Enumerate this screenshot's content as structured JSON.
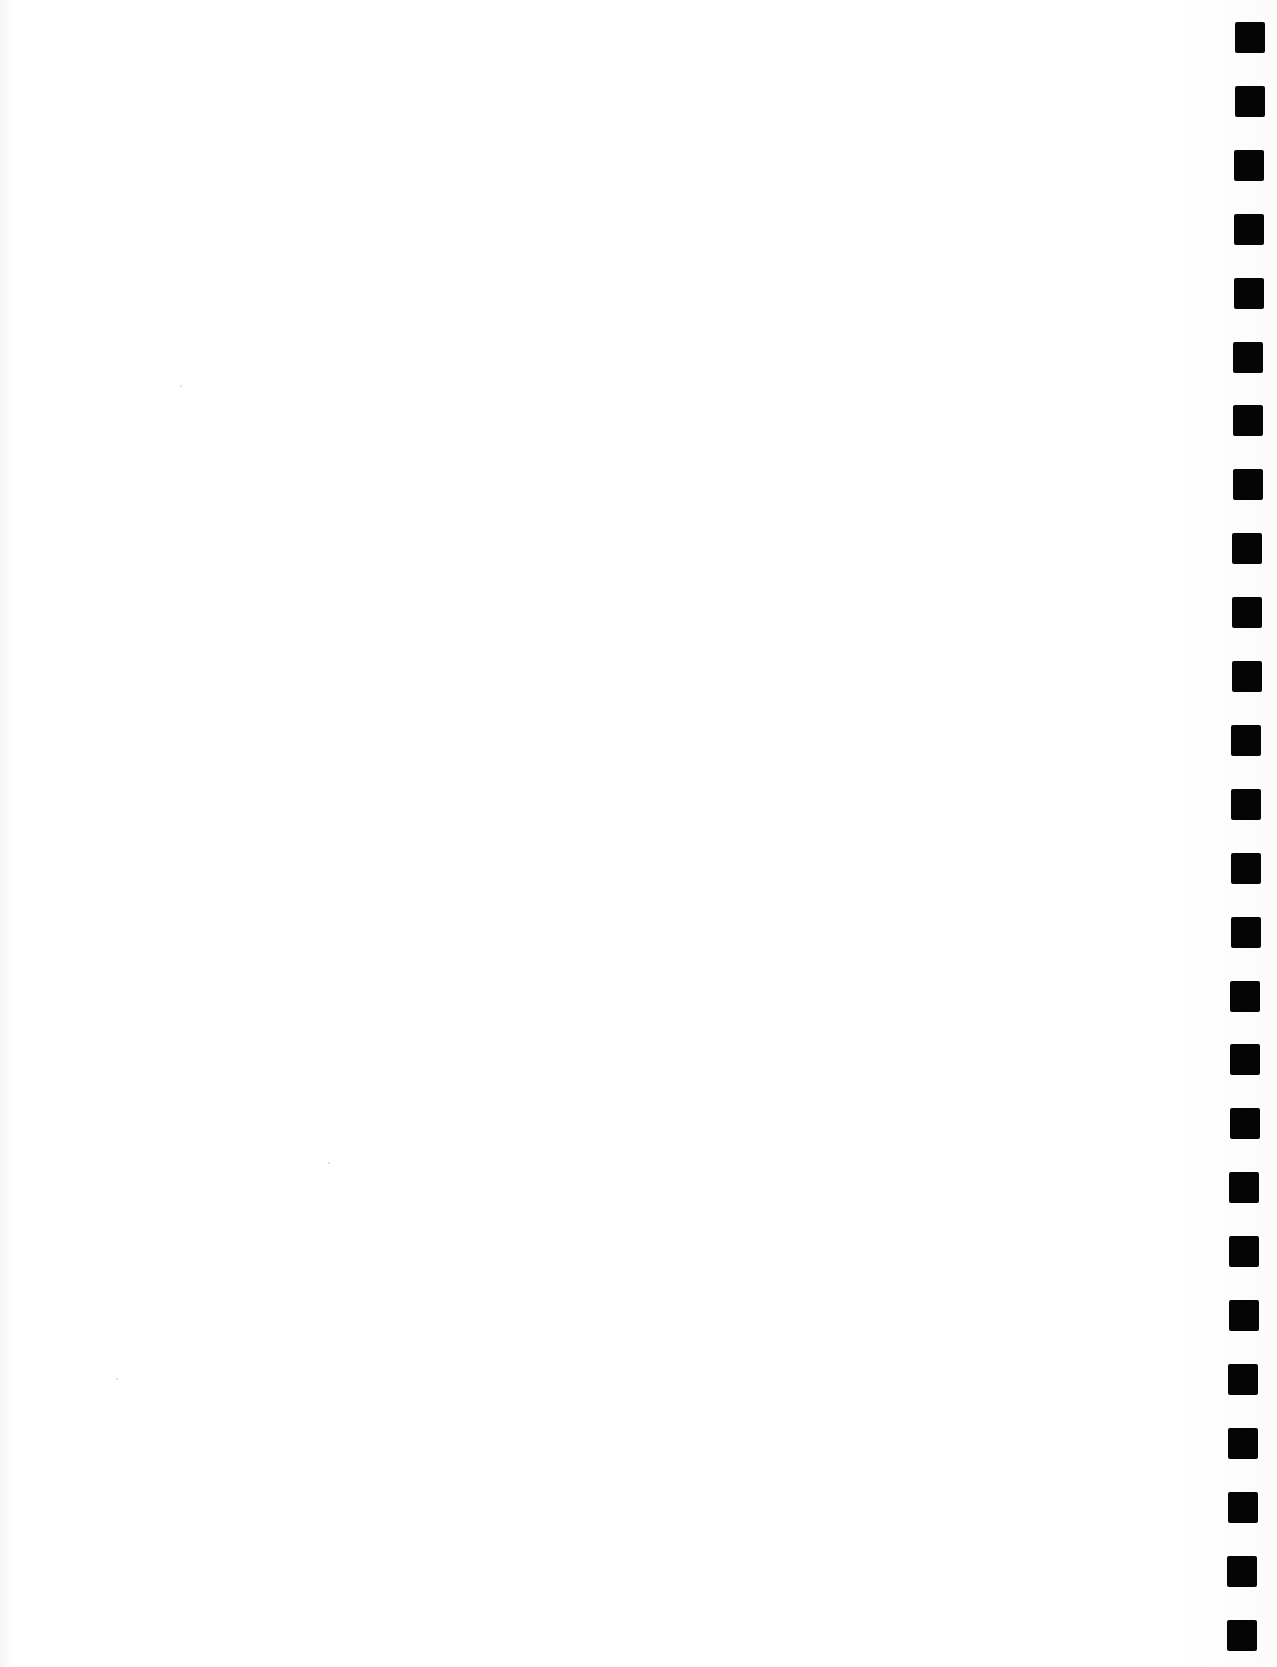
{
  "document": {
    "type": "scanned-blank-page",
    "body_text": "",
    "background_color": "#ffffff"
  },
  "binding_marks": {
    "count": 26,
    "color": "#050505",
    "side": "right",
    "shape": "square",
    "size_px": [
      30,
      31
    ],
    "first_top_px": 22,
    "pitch_px": 64
  }
}
